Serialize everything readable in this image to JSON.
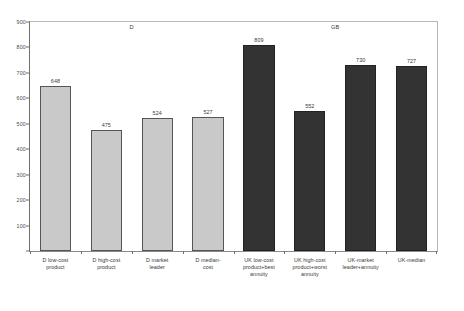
{
  "chart_data": {
    "type": "bar",
    "title": "",
    "xlabel": "",
    "ylabel": "",
    "ylim": [
      0,
      900
    ],
    "yticks": [
      0,
      100,
      200,
      300,
      400,
      500,
      600,
      700,
      800,
      900
    ],
    "ytick_labels": [
      "",
      "100",
      "200",
      "300",
      "400",
      "500",
      "600",
      "700",
      "800",
      "900"
    ],
    "grid": false,
    "legend": "none",
    "categories": [
      "D low-cost\nproduct",
      "D high-cost\nproduct",
      "D market\nleader",
      "D median-\ncost",
      "UK low-cost\nproduct+best\nannuity",
      "UK high-cost\nproduct+worst\nannuity",
      "UK-market\nleader+annuity",
      "UK-median"
    ],
    "values": [
      648,
      475,
      524,
      527,
      809,
      552,
      730,
      727
    ],
    "value_labels": [
      "648",
      "475",
      "524",
      "527",
      "809",
      "552",
      "730",
      "727"
    ],
    "bar_styles": [
      "light",
      "light",
      "light",
      "light",
      "dark",
      "dark",
      "dark",
      "dark"
    ],
    "groups": [
      {
        "label": "D",
        "center_index": 1.5
      },
      {
        "label": "GB",
        "center_index": 5.5
      }
    ],
    "colors": {
      "light_bar": "#c9c9c9",
      "light_bar_border": "#555555",
      "dark_bar": "#333333",
      "dark_bar_border": "#222222",
      "axis": "#6e6e6e",
      "text": "#3a3a3a",
      "background": "#ffffff"
    }
  }
}
